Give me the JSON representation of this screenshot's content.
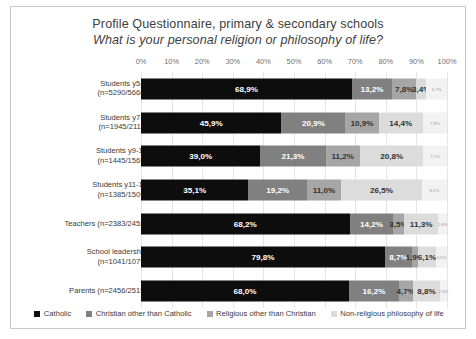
{
  "chart_data": {
    "type": "bar",
    "subtype": "stacked-horizontal-100",
    "title": "Profile Questionnaire, primary & secondary schools",
    "subtitle": "What is your personal religion or philosophy of life?",
    "xlabel": "",
    "ylabel": "",
    "xlim": [
      0,
      100
    ],
    "grid": true,
    "legend_position": "bottom",
    "tick_labels": [
      "0%",
      "10%",
      "20%",
      "30%",
      "40%",
      "50%",
      "60%",
      "70%",
      "80%",
      "90%",
      "100%"
    ],
    "tick_values": [
      0,
      10,
      20,
      30,
      40,
      50,
      60,
      70,
      80,
      90,
      100
    ],
    "categories": [
      "Students y5-6\n(n=5290/5668)",
      "Students y7-8\n(n=1945/2111)",
      "Students y9-10\n(n=1445/1565)",
      "Students y11-12\n(n=1385/1509)",
      "Teachers (n=2383/2452)",
      "School leadership\n(n=1041/1079)",
      "Parents (n=2456/2515)"
    ],
    "series": [
      {
        "name": "Catholic",
        "color": "#0d0d0d",
        "values": [
          68.9,
          45.9,
          39.0,
          35.1,
          68.2,
          79.8,
          68.0
        ],
        "labels": [
          "68,9%",
          "45,9%",
          "39,0%",
          "35,1%",
          "68,2%",
          "79,8%",
          "68,0%"
        ]
      },
      {
        "name": "Christian other than Catholic",
        "color": "#808080",
        "values": [
          13.2,
          20.9,
          21.3,
          19.2,
          14.2,
          8.7,
          16.2
        ],
        "labels": [
          "13,2%",
          "20,9%",
          "21,3%",
          "19,2%",
          "14,2%",
          "8,7%",
          "16,2%"
        ]
      },
      {
        "name": "Religious other than Christian",
        "color": "#a6a6a6",
        "values": [
          7.8,
          10.9,
          11.2,
          11.0,
          3.5,
          1.9,
          4.7
        ],
        "labels": [
          "7,8%",
          "10,9%",
          "11,2%",
          "11,0%",
          "3,5%",
          "1,9%",
          "4,7%"
        ]
      },
      {
        "name": "Non-religious philosophy of life",
        "color": "#dcdcdc",
        "values": [
          3.4,
          14.4,
          20.8,
          26.5,
          11.3,
          6.1,
          8.8
        ],
        "labels": [
          "3,4%",
          "14,4%",
          "20,8%",
          "26,5%",
          "11,3%",
          "6,1%",
          "8,8%"
        ]
      },
      {
        "name": "other",
        "color": "#f2f2f2",
        "values": [
          6.7,
          7.9,
          7.7,
          8.2,
          2.8,
          3.5,
          2.3
        ],
        "labels": [
          "6,7%",
          "7,9%",
          "7,7%",
          "8,2%",
          "2,8%",
          "3,5%",
          "2,3%"
        ]
      }
    ]
  }
}
